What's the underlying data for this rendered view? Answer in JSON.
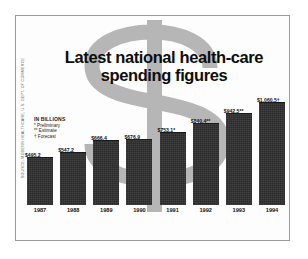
{
  "figure": {
    "headline_line1": "Latest national health-care",
    "headline_line2": "spending figures",
    "source_credit": "SOURCE: MODERN HEALTHCARE, U.S. DEPT. OF COMMERCE",
    "watermark_symbol": "$",
    "border_color": "#9a9a9a",
    "background_color": "#ffffff",
    "bar_color": "#2b2b2b",
    "watermark_color": "#b5b5b5"
  },
  "legend": {
    "title": "IN BILLIONS",
    "notes": [
      "* Preliminary",
      "** Estimate",
      "† Forecast"
    ]
  },
  "chart_data": {
    "type": "bar",
    "title": "Latest national health-care spending figures",
    "xlabel": "",
    "ylabel": "IN BILLIONS",
    "ylim": [
      0,
      1100
    ],
    "grid": false,
    "legend_position": "none",
    "categories": [
      "1987",
      "1988",
      "1989",
      "1990",
      "1991",
      "1992",
      "1993",
      "1994"
    ],
    "values": [
      495.2,
      547.2,
      666.4,
      676.9,
      753.1,
      840.4,
      942.5,
      1060.5
    ],
    "data_labels": [
      "$495.2",
      "$547.2",
      "$666.4",
      "$676.9",
      "$753.1*",
      "$840.4**",
      "$942.5**",
      "$1,060.5†"
    ],
    "annotations": [
      "* Preliminary",
      "** Estimate",
      "† Forecast"
    ]
  }
}
